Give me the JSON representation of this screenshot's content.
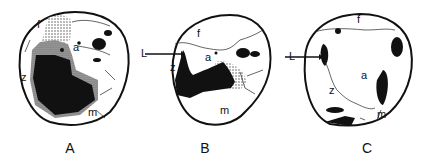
{
  "figure": {
    "panels": [
      {
        "id": "A",
        "caption": "A",
        "labels": {
          "f": "f",
          "a": "a",
          "z": "z",
          "m": "m"
        }
      },
      {
        "id": "B",
        "caption": "B",
        "labels": {
          "L": "L",
          "f": "f",
          "a": "a",
          "z": "z",
          "m": "m"
        }
      },
      {
        "id": "C",
        "caption": "C",
        "labels": {
          "L": "L",
          "f": "f",
          "a": "a",
          "z": "z",
          "m": "m"
        }
      }
    ]
  },
  "colors": {
    "ink": "#111111",
    "stipple": "#9a9a9a",
    "background": "#ffffff"
  }
}
